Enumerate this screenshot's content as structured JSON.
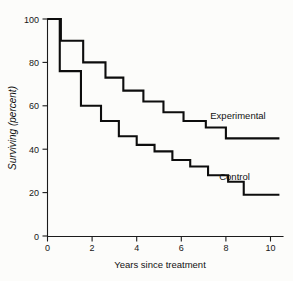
{
  "chart_data": {
    "type": "line",
    "title": "",
    "xlabel": "Years since treatment",
    "ylabel": "Surviving (percent)",
    "xlim": [
      0,
      10.6
    ],
    "ylim": [
      0,
      100
    ],
    "xticks": [
      0,
      2,
      4,
      6,
      8,
      10
    ],
    "yticks": [
      0,
      20,
      40,
      60,
      80,
      100
    ],
    "grid": false,
    "legend_position": "inline-right",
    "step_style": "post",
    "series": [
      {
        "name": "Experimental",
        "label": "Experimental",
        "label_x": 7.3,
        "label_y": 54,
        "color": "#0d0d0d",
        "x": [
          0.0,
          0.6,
          1.6,
          2.6,
          3.4,
          4.3,
          5.2,
          6.1,
          7.1,
          8.0,
          10.4
        ],
        "y": [
          100,
          90,
          80,
          73,
          67,
          62,
          57,
          53,
          50,
          45,
          45
        ]
      },
      {
        "name": "Control",
        "label": "Control",
        "label_x": 7.7,
        "label_y": 26,
        "color": "#0d0d0d",
        "x": [
          0.0,
          0.55,
          1.5,
          2.4,
          3.2,
          4.0,
          4.8,
          5.6,
          6.4,
          7.2,
          8.1,
          8.8,
          10.4
        ],
        "y": [
          100,
          76,
          60,
          53,
          46,
          42,
          39,
          35,
          32,
          28,
          25,
          19,
          19
        ]
      }
    ]
  },
  "axis": {
    "y_tick_labels": [
      "0",
      "20",
      "40",
      "60",
      "80",
      "100"
    ],
    "x_tick_labels": [
      "0",
      "2",
      "4",
      "6",
      "8",
      "10"
    ],
    "x_title": "Years since treatment",
    "y_title": "Surviving (percent)"
  },
  "series_labels": {
    "experimental": "Experimental",
    "control": "Control"
  }
}
